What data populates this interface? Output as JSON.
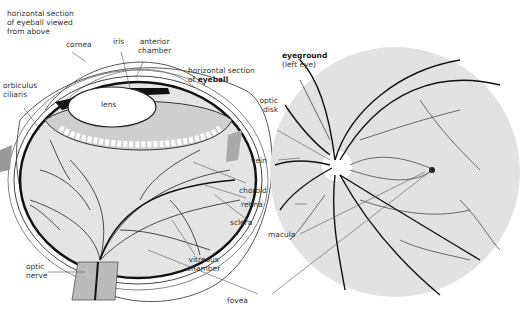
{
  "diagram": {
    "title_left": [
      "horizontal section",
      "of eyeball viewed",
      "from above"
    ],
    "section_label": {
      "line1": "horizontal section",
      "line2_prefix": "of ",
      "line2_bold": "eyeball"
    },
    "eyeground_label": {
      "bold": "eyeground",
      "sub": "(left eye)"
    },
    "labels": {
      "cornea": "cornea",
      "iris": "iris",
      "anterior_chamber": [
        "anterior",
        "chamber"
      ],
      "orbiculus_ciliaris": [
        "orbiculus",
        "ciliaris"
      ],
      "lens": "lens",
      "optic_disk": [
        "optic",
        "disk"
      ],
      "vein": "vein",
      "choroid": "choroid",
      "retina": "retina",
      "macula": "macula",
      "sclera": "sclera",
      "vitreous_chamber": [
        "vitreous",
        "chamber"
      ],
      "optic_nerve": [
        "optic",
        "nerve"
      ],
      "fovea": "fovea"
    }
  }
}
